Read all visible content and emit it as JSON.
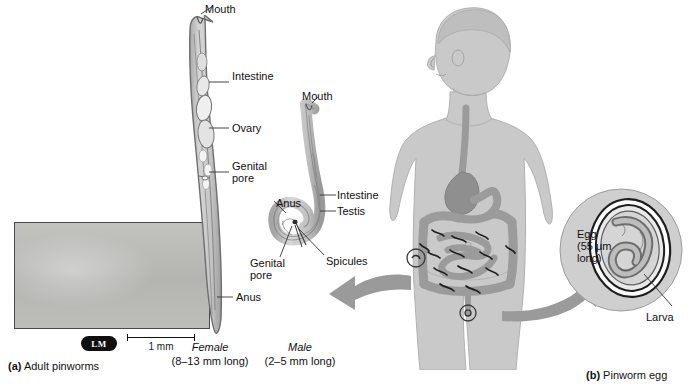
{
  "figure": {
    "panel_a": {
      "caption_marker": "(a)",
      "caption_text": "Adult pinworms",
      "micrograph_badge": "LM",
      "scale_label": "1 mm"
    },
    "panel_b": {
      "caption_marker": "(b)",
      "caption_text": "Pinworm egg"
    },
    "female": {
      "title": "Female",
      "size": "(8–13 mm long)",
      "labels": [
        "Mouth",
        "Intestine",
        "Ovary",
        "Genital\npore",
        "Anus"
      ]
    },
    "male": {
      "title": "Male",
      "size": "(2–5 mm long)",
      "labels": [
        "Mouth",
        "Intestine",
        "Testis",
        "Anus",
        "Genital\npore",
        "Spicules"
      ]
    },
    "egg": {
      "label": "Egg\n(55 μm\nlong)",
      "larva_label": "Larva"
    },
    "labels_flat": {
      "mouth": "Mouth",
      "intestine": "Intestine",
      "ovary": "Ovary",
      "genital_pore": "Genital\npore",
      "anus": "Anus",
      "testis": "Testis",
      "spicules": "Spicules",
      "larva": "Larva",
      "egg": "Egg\n(55 μm\nlong)"
    },
    "colors": {
      "body_fill": "#c9c9c9",
      "organ_fill": "#9b9b9b",
      "arrow_fill": "#9a9a9a",
      "worm_fill": "#c4c4c4",
      "outline": "#6a6a6a",
      "text": "#111111"
    }
  }
}
